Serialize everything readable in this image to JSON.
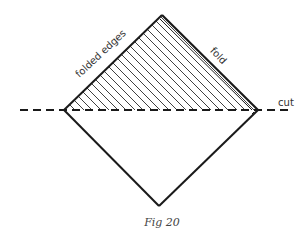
{
  "figure": {
    "caption": "Fig 20",
    "labels": {
      "folded_edges": "folded edges",
      "fold": "fold",
      "cut": "cut"
    },
    "colors": {
      "stroke": "#1a1a1a",
      "hatch": "#2a2a2a",
      "text": "#333333",
      "background": "#ffffff"
    },
    "shape": {
      "type": "square rotated 45° (diamond)",
      "vertices": {
        "top": [
          162,
          15
        ],
        "left": [
          64,
          110
        ],
        "right": [
          258,
          110
        ],
        "bottom": [
          159,
          206
        ]
      },
      "upper_half": "hatched (folded layers)",
      "lower_half": "plain"
    },
    "cut_line": {
      "style": "dashed",
      "y": 110,
      "x_start": 20,
      "x_end": 292
    }
  }
}
